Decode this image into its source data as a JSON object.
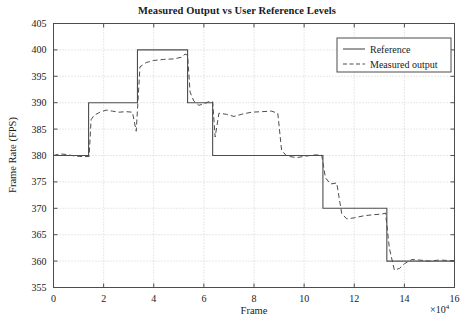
{
  "chart_data": {
    "type": "line",
    "title": "Measured Output vs User Reference Levels",
    "xlabel": "Frame",
    "ylabel": "Frame Rate (FPS)",
    "x_exponent_label": "×10",
    "x_exponent_power": "4",
    "xlim": [
      0,
      16
    ],
    "ylim": [
      355,
      405
    ],
    "xticks": [
      0,
      2,
      4,
      6,
      8,
      10,
      12,
      14,
      16
    ],
    "xtick_labels": [
      "0",
      "2",
      "4",
      "6",
      "8",
      "10",
      "12",
      "14",
      "16"
    ],
    "yticks": [
      355,
      360,
      365,
      370,
      375,
      380,
      385,
      390,
      395,
      400,
      405
    ],
    "ytick_labels": [
      "355",
      "360",
      "365",
      "370",
      "375",
      "380",
      "385",
      "390",
      "395",
      "400",
      "405"
    ],
    "grid": true,
    "grid_style": "dotted",
    "legend_position": "top-right",
    "line_color": "#4d4d4d",
    "grid_color": "#bfbfbf",
    "axis_color": "#4d4d4d",
    "series": [
      {
        "name": "Reference",
        "style": "solid",
        "steps": [
          {
            "x_start": 0.0,
            "x_end": 1.4,
            "y": 380
          },
          {
            "x_start": 1.4,
            "x_end": 3.35,
            "y": 390
          },
          {
            "x_start": 3.35,
            "x_end": 5.35,
            "y": 400
          },
          {
            "x_start": 5.35,
            "x_end": 6.35,
            "y": 390
          },
          {
            "x_start": 6.35,
            "x_end": 10.75,
            "y": 380
          },
          {
            "x_start": 10.75,
            "x_end": 13.3,
            "y": 370
          },
          {
            "x_start": 13.3,
            "x_end": 16.0,
            "y": 360
          }
        ]
      },
      {
        "name": "Measured output",
        "style": "dashed",
        "points": [
          [
            0.0,
            380.0
          ],
          [
            0.25,
            380.3
          ],
          [
            0.5,
            380.2
          ],
          [
            0.85,
            379.9
          ],
          [
            1.15,
            379.8
          ],
          [
            1.42,
            379.8
          ],
          [
            1.5,
            386.8
          ],
          [
            1.62,
            387.6
          ],
          [
            1.85,
            388.2
          ],
          [
            2.1,
            388.6
          ],
          [
            2.35,
            388.4
          ],
          [
            2.6,
            388.2
          ],
          [
            2.9,
            388.3
          ],
          [
            3.15,
            388.2
          ],
          [
            3.3,
            384.6
          ],
          [
            3.45,
            396.8
          ],
          [
            3.7,
            397.6
          ],
          [
            4.0,
            398.0
          ],
          [
            4.4,
            398.2
          ],
          [
            4.8,
            398.3
          ],
          [
            5.1,
            398.6
          ],
          [
            5.25,
            399.2
          ],
          [
            5.35,
            399.0
          ],
          [
            5.45,
            392.0
          ],
          [
            5.6,
            390.3
          ],
          [
            5.8,
            389.5
          ],
          [
            6.0,
            389.8
          ],
          [
            6.2,
            390.2
          ],
          [
            6.35,
            390.2
          ],
          [
            6.45,
            383.5
          ],
          [
            6.6,
            388.0
          ],
          [
            6.9,
            387.8
          ],
          [
            7.2,
            387.4
          ],
          [
            7.5,
            387.8
          ],
          [
            7.9,
            388.2
          ],
          [
            8.3,
            388.3
          ],
          [
            8.7,
            388.4
          ],
          [
            8.95,
            388.0
          ],
          [
            9.1,
            381.0
          ],
          [
            9.3,
            379.9
          ],
          [
            9.7,
            379.6
          ],
          [
            10.1,
            379.9
          ],
          [
            10.4,
            380.1
          ],
          [
            10.7,
            380.1
          ],
          [
            10.85,
            375.8
          ],
          [
            11.05,
            374.6
          ],
          [
            11.3,
            374.8
          ],
          [
            11.5,
            369.0
          ],
          [
            11.7,
            368.0
          ],
          [
            12.0,
            368.2
          ],
          [
            12.4,
            368.6
          ],
          [
            12.8,
            368.8
          ],
          [
            13.1,
            368.9
          ],
          [
            13.25,
            369.1
          ],
          [
            13.4,
            362.5
          ],
          [
            13.6,
            358.3
          ],
          [
            13.8,
            358.6
          ],
          [
            14.0,
            359.5
          ],
          [
            14.3,
            360.3
          ],
          [
            14.6,
            360.2
          ],
          [
            15.0,
            360.0
          ],
          [
            15.4,
            360.2
          ],
          [
            15.8,
            360.1
          ],
          [
            16.0,
            360.1
          ]
        ]
      }
    ]
  },
  "legend": {
    "entries": [
      {
        "label": "Reference",
        "style": "solid"
      },
      {
        "label": "Measured output",
        "style": "dashed"
      }
    ]
  }
}
